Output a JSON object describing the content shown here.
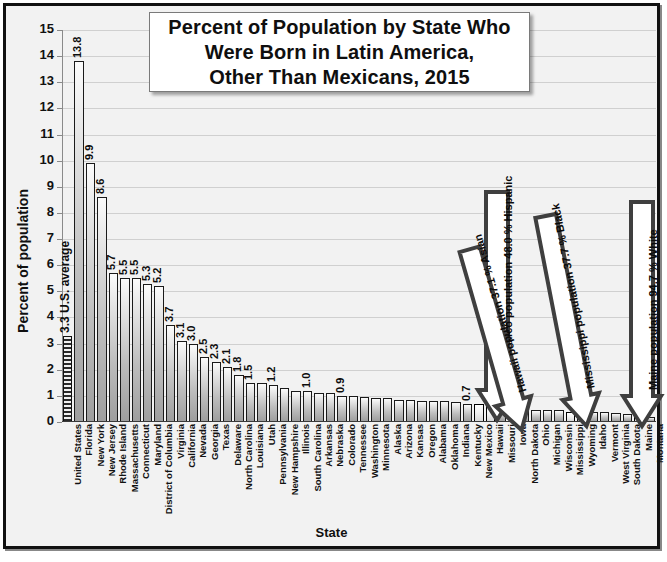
{
  "chart_data": {
    "type": "bar",
    "title": "Percent of Population by State Who Were Born in Latin America, Other Than Mexicans,  2015",
    "title_lines": [
      "Percent of Population by State Who",
      "Were Born in Latin America,",
      "Other Than Mexicans,  2015"
    ],
    "xlabel": "State",
    "ylabel": "Percent of population",
    "ylim": [
      0,
      15
    ],
    "ytick_step": 1,
    "yticks": [
      "0",
      "1",
      "2",
      "3",
      "4",
      "5",
      "6",
      "7",
      "8",
      "9",
      "10",
      "11",
      "12",
      "13",
      "14",
      "15"
    ],
    "grid": true,
    "legend": "none",
    "categories": [
      "United States",
      "Florida",
      "New York",
      "New Jersey",
      "Rhode Island",
      "Massachusetts",
      "Connecticut",
      "Maryland",
      "District of Columbia",
      "Virginia",
      "California",
      "Nevada",
      "Georgia",
      "Texas",
      "Delaware",
      "North Carolina",
      "Louisiana",
      "Utah",
      "Pennsylvania",
      "New Hampshire",
      "Illinois",
      "South Carolina",
      "Arkansas",
      "Nebraska",
      "Colorado",
      "Tennessee",
      "Washington",
      "Minnesota",
      "Alaska",
      "Arizona",
      "Kansas",
      "Oregon",
      "Alabama",
      "Oklahoma",
      "Indiana",
      "Kentucky",
      "New Mexico",
      "Hawaii",
      "Missouri",
      "Iowa",
      "North Dakota",
      "Ohio",
      "Michigan",
      "Wisconsin",
      "Mississippi",
      "Wyoming",
      "Idaho",
      "Vermont",
      "West Virginia",
      "South Dakota",
      "Maine",
      "Montana"
    ],
    "values": [
      3.3,
      13.8,
      9.9,
      8.6,
      5.7,
      5.5,
      5.5,
      5.3,
      5.2,
      3.7,
      3.1,
      3.0,
      2.5,
      2.3,
      2.1,
      1.8,
      1.5,
      1.5,
      1.4,
      1.3,
      1.2,
      1.2,
      1.1,
      1.1,
      1.0,
      1.0,
      0.95,
      0.9,
      0.9,
      0.85,
      0.85,
      0.8,
      0.8,
      0.8,
      0.75,
      0.7,
      0.7,
      0.6,
      0.5,
      0.5,
      0.5,
      0.45,
      0.45,
      0.45,
      0.4,
      0.4,
      0.4,
      0.4,
      0.35,
      0.3,
      0.3,
      0.2
    ],
    "value_labels": {
      "United States": "3.3 U.S. average",
      "Florida": "13.8",
      "New York": "9.9",
      "New Jersey": "8.6",
      "Rhode Island": "5.7",
      "Massachusetts": "5.5",
      "Connecticut": "5.5",
      "Maryland": "5.3",
      "District of Columbia": "5.2",
      "Virginia": "3.7",
      "California": "3.1",
      "Nevada": "3.0",
      "Georgia": "2.5",
      "Texas": "2.3",
      "Delaware": "2.1",
      "North Carolina": "1.8",
      "Louisiana": "1.5",
      "Pennsylvania": "1.2",
      "South Carolina": "1.0",
      "Colorado": "0.9",
      "Kentucky": "0.7",
      "Hawaii": "0.5",
      "Montana": "0.2"
    },
    "highlighted_bars": [
      "New Mexico",
      "Hawaii",
      "Mississippi",
      "Maine"
    ],
    "annotations": [
      {
        "id": "new-mexico",
        "text": "New Mexico population 48.0 % Hispanic",
        "target": "New Mexico"
      },
      {
        "id": "hawaii",
        "text": "Hawaii population 37.1 % Asian",
        "target": "Hawaii"
      },
      {
        "id": "mississippi",
        "text": "Mississippi population 37.7 % Black",
        "target": "Mississippi"
      },
      {
        "id": "maine",
        "text": "Maine population 94.7 % White",
        "target": "Maine"
      }
    ],
    "colors": {
      "background": "#f2f2f2",
      "bar_light": "#e4e4e4",
      "bar_dark": "#9e9e9e",
      "bar_outline": "#1a1a1a",
      "gridline": "#d0d0d0",
      "title_box": "#ffffff",
      "text": "#101010"
    }
  }
}
